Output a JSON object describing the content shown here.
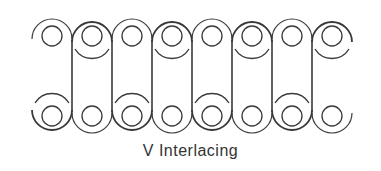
{
  "caption": "V Interlacing",
  "diagram": {
    "type": "chain-interlacing",
    "stroke_color": "#3a3a3a",
    "columns_x": [
      52,
      92,
      132,
      172,
      212,
      252,
      292,
      332
    ],
    "top_y": 36,
    "bottom_y": 116,
    "inner_radius": 10,
    "outer_radius": 20,
    "verticals_x": [
      72,
      112,
      152,
      192,
      232,
      272,
      312
    ],
    "top_full_rings": [
      92,
      172,
      252,
      332
    ],
    "top_half_arcs": [
      52,
      132,
      212,
      292
    ],
    "bottom_full_rings": [
      52,
      132,
      212,
      292
    ],
    "bottom_half_arcs": [
      92,
      172,
      252,
      332
    ]
  }
}
